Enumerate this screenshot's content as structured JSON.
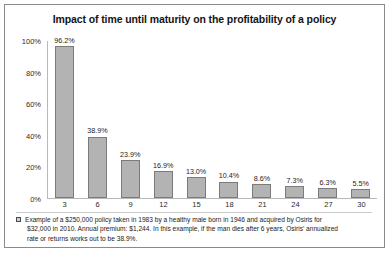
{
  "chart_data": {
    "type": "bar",
    "title": "Impact of time until maturity on the profitability of a policy",
    "xlabel": "",
    "ylabel": "",
    "categories": [
      "3",
      "6",
      "9",
      "12",
      "15",
      "18",
      "21",
      "24",
      "27",
      "30"
    ],
    "values": [
      96.2,
      38.9,
      23.9,
      16.9,
      13.0,
      10.4,
      8.6,
      7.3,
      6.3,
      5.5
    ],
    "data_labels": [
      "96.2%",
      "38.9%",
      "23.9%",
      "16.9%",
      "13.0%",
      "10.4%",
      "8.6%",
      "7.3%",
      "6.3%",
      "5.5%"
    ],
    "ylim": [
      0,
      100
    ],
    "yticks": [
      0,
      20,
      40,
      60,
      80,
      100
    ],
    "ytick_labels": [
      "0%",
      "20%",
      "40%",
      "60%",
      "80%",
      "100%"
    ],
    "grid": false,
    "legend": {
      "position": "bottom",
      "marker_color": "#cfcfcf",
      "entries": [
        "Example of a $250,000 policy taken in 1983 by a healthy male born in 1946 and acquired by Osiris for $32,000 in 2010. Annual premium: $1,244. In this example, if the man dies after 6 years, Osiris' annualized rate or returns works out to be 38.9%."
      ]
    },
    "bar_color": "#b3b3b3",
    "bar_border_color": "#7b7b7b"
  },
  "footnote": {
    "line1": "Example of a $250,000 policy taken in 1983 by a healthy male born in 1946 and acquired by Osiris for",
    "line2": "$32,000 in 2010. Annual premium: $1,244. In this example, if the man dies after 6 years, Osiris' annualized",
    "line3": "rate or returns works out to be 38.9%."
  }
}
